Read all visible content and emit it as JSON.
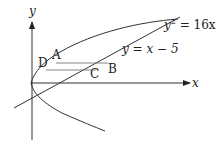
{
  "diagram": {
    "axes": {
      "x_label": "x",
      "y_label": "y"
    },
    "curves": [
      {
        "name": "parabola",
        "equation_lhs": "y",
        "equation_sup": "2",
        "equation_rhs": " = 16x"
      },
      {
        "name": "line",
        "equation": "y = x − 5"
      }
    ],
    "points": [
      {
        "label": "A"
      },
      {
        "label": "B"
      },
      {
        "label": "C"
      },
      {
        "label": "D"
      }
    ],
    "segments": [
      "AB",
      "DC"
    ]
  }
}
